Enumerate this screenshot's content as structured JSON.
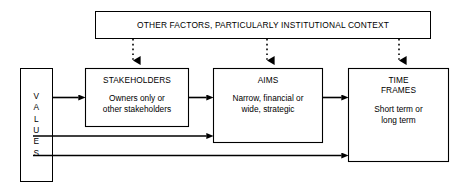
{
  "diagram": {
    "colors": {
      "stroke": "#000000",
      "fill": "#ffffff",
      "background": "#ffffff"
    },
    "banner": {
      "label": "OTHER FACTORS, PARTICULARLY INSTITUTIONAL CONTEXT"
    },
    "values": {
      "label": "V\nA\nL\nU\nE\nS",
      "plain_label": "VALUES"
    },
    "stakeholders": {
      "title": "STAKEHOLDERS",
      "body": "Owners only or\nother stakeholders"
    },
    "aims": {
      "title": "AIMS",
      "body": "Narrow, financial or\nwide, strategic"
    },
    "timeframes": {
      "title": "TIME\nFRAMES",
      "body": "Short term or\nlong term"
    },
    "connectors": [
      {
        "name": "values-to-stakeholders",
        "style": "solid-arrow"
      },
      {
        "name": "stakeholders-to-aims",
        "style": "solid-arrow"
      },
      {
        "name": "aims-to-timeframes",
        "style": "solid-arrow"
      },
      {
        "name": "values-to-aims",
        "style": "solid-arrow"
      },
      {
        "name": "values-to-timeframes",
        "style": "solid-arrow"
      },
      {
        "name": "banner-to-stakeholders",
        "style": "dotted-arrow"
      },
      {
        "name": "banner-to-aims",
        "style": "dotted-arrow"
      },
      {
        "name": "banner-to-timeframes",
        "style": "dotted-arrow"
      }
    ]
  }
}
